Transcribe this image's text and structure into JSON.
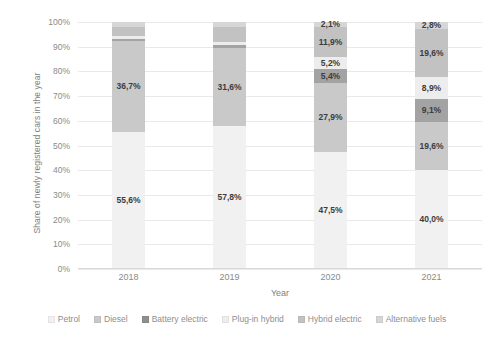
{
  "chart_data": {
    "type": "bar",
    "stacked": true,
    "title": "",
    "xlabel": "Year",
    "ylabel": "Share of newly registered cars in the year",
    "categories": [
      "2018",
      "2019",
      "2020",
      "2021"
    ],
    "ylim": [
      0,
      100
    ],
    "ytick_labels": [
      "0%",
      "10%",
      "20%",
      "30%",
      "40%",
      "50%",
      "60%",
      "70%",
      "80%",
      "90%",
      "100%"
    ],
    "ytick_values": [
      0,
      10,
      20,
      30,
      40,
      50,
      60,
      70,
      80,
      90,
      100
    ],
    "grid": true,
    "legend_position": "bottom",
    "series": [
      {
        "name": "Petrol",
        "color": "#f1f1f1",
        "values": [
          55.6,
          57.8,
          47.5,
          40.0
        ],
        "labels": [
          "55,6%",
          "57,8%",
          "47,5%",
          "40,0%"
        ]
      },
      {
        "name": "Diesel",
        "color": "#c9c9c9",
        "values": [
          36.7,
          31.6,
          27.9,
          19.6
        ],
        "labels": [
          "36,7%",
          "31,6%",
          "27,9%",
          "19,6%"
        ]
      },
      {
        "name": "Battery electric",
        "color": "#a3a3a3",
        "values": [
          1.0,
          1.3,
          5.4,
          9.1
        ],
        "labels": [
          "",
          "",
          "5,4%",
          "9,1%"
        ]
      },
      {
        "name": "Plug-in hybrid",
        "color": "#ededed",
        "values": [
          1.0,
          1.1,
          5.2,
          8.9
        ],
        "labels": [
          "",
          "",
          "5,2%",
          "8,9%"
        ]
      },
      {
        "name": "Hybrid electric",
        "color": "#c2c2c2",
        "values": [
          3.8,
          6.3,
          11.9,
          19.6
        ],
        "labels": [
          "",
          "",
          "11,9%",
          "19,6%"
        ]
      },
      {
        "name": "Alternative fuels",
        "color": "#d6d6d6",
        "values": [
          1.9,
          1.9,
          2.1,
          2.8
        ],
        "labels": [
          "",
          "",
          "2,1%",
          "2,8%"
        ]
      }
    ]
  },
  "legend": {
    "items": [
      {
        "label": "Petrol",
        "color": "#f1f1f1"
      },
      {
        "label": "Diesel",
        "color": "#c9c9c9"
      },
      {
        "label": "Battery electric",
        "color": "#8f8f8f"
      },
      {
        "label": "Plug-in hybrid",
        "color": "#ededed"
      },
      {
        "label": "Hybrid electric",
        "color": "#c2c2c2"
      },
      {
        "label": "Alternative fuels",
        "color": "#d6d6d6"
      }
    ]
  }
}
